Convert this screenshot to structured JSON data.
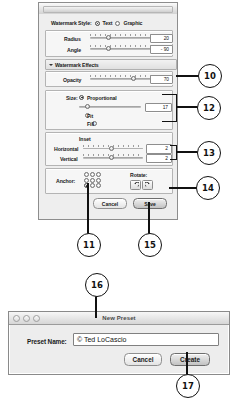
{
  "watermark_dialog": {
    "title": "",
    "style_row": {
      "label": "Watermark Style:",
      "options": [
        {
          "label": "Text",
          "selected": true
        },
        {
          "label": "Graphic",
          "selected": false
        }
      ]
    },
    "basic": {
      "rows": [
        {
          "label": "Radius",
          "value": "20"
        },
        {
          "label": "Angle",
          "value": "- 90"
        }
      ]
    },
    "effects_section": {
      "title": "Watermark Effects",
      "disclosure": "triangle-down-icon",
      "opacity": {
        "label": "Opacity",
        "value": "70"
      }
    },
    "size_section": {
      "label": "Size:",
      "options": [
        {
          "label": "Proportional",
          "selected": true
        },
        {
          "label": "Fit",
          "selected": false
        },
        {
          "label": "Fill",
          "selected": false
        }
      ],
      "value": "17"
    },
    "inset_section": {
      "title": "Inset",
      "rows": [
        {
          "label": "Horizontal",
          "value": "2"
        },
        {
          "label": "Vertical",
          "value": "2"
        }
      ]
    },
    "anchor_section": {
      "label": "Anchor:",
      "selected_index": 6
    },
    "rotate_section": {
      "label": "Rotate:",
      "buttons": [
        {
          "name": "rotate-counterclockwise-icon"
        },
        {
          "name": "rotate-clockwise-icon"
        }
      ]
    },
    "footer": {
      "cancel_label": "Cancel",
      "save_label": "Save"
    }
  },
  "preset_dialog": {
    "title": "New Preset",
    "window_controls": [
      "close-button",
      "minimize-button",
      "zoom-button"
    ],
    "field": {
      "label": "Preset Name:",
      "value": "© Ted LoCascio",
      "placeholder": "Preset Name"
    },
    "footer": {
      "cancel_label": "Cancel",
      "create_label": "Create"
    }
  },
  "callouts": [
    {
      "number": "10"
    },
    {
      "number": "11"
    },
    {
      "number": "12"
    },
    {
      "number": "13"
    },
    {
      "number": "14"
    },
    {
      "number": "15"
    },
    {
      "number": "16"
    },
    {
      "number": "17"
    }
  ]
}
